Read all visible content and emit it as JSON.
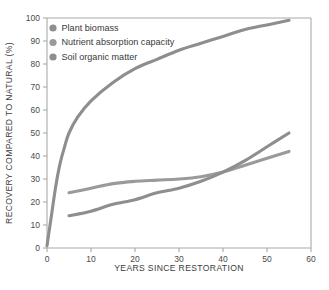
{
  "chart_data": {
    "type": "line",
    "title": "",
    "xlabel": "YEARS SINCE RESTORATION",
    "ylabel": "RECOVERY COMPARED TO NATURAL (%)",
    "xlim": [
      0,
      60
    ],
    "ylim": [
      0,
      100
    ],
    "xticks": [
      0,
      10,
      20,
      30,
      40,
      50,
      60
    ],
    "yticks": [
      0,
      10,
      20,
      30,
      40,
      50,
      60,
      70,
      80,
      90,
      100
    ],
    "grid": false,
    "legend_position": "top-left",
    "series": [
      {
        "name": "Plant biomass",
        "color": "#8e8e8e",
        "x": [
          0,
          1,
          2,
          3,
          4,
          5,
          7,
          10,
          15,
          20,
          25,
          30,
          35,
          40,
          45,
          50,
          55
        ],
        "y": [
          1,
          14,
          27,
          37,
          44,
          50,
          57,
          64,
          72,
          78,
          82,
          86,
          89,
          92,
          95,
          97,
          99
        ]
      },
      {
        "name": "Nutrient absorption capacity",
        "color": "#9a9a9a",
        "x": [
          5,
          10,
          15,
          20,
          25,
          30,
          35,
          40,
          45,
          50,
          55
        ],
        "y": [
          24,
          26,
          28,
          29,
          29.5,
          30,
          31,
          33,
          36,
          39,
          42
        ]
      },
      {
        "name": "Soil organic matter",
        "color": "#8e8e8e",
        "x": [
          5,
          10,
          15,
          20,
          25,
          30,
          35,
          40,
          45,
          50,
          55
        ],
        "y": [
          14,
          16,
          19,
          21,
          24,
          26,
          29,
          33,
          38,
          44,
          50
        ]
      }
    ]
  },
  "legend": {
    "items": [
      {
        "label": "Plant biomass",
        "color": "#8e8e8e"
      },
      {
        "label": "Nutrient absorption capacity",
        "color": "#9a9a9a"
      },
      {
        "label": "Soil organic matter",
        "color": "#8e8e8e"
      }
    ]
  },
  "axes": {
    "x_title": "YEARS SINCE RESTORATION",
    "y_title": "RECOVERY COMPARED TO NATURAL (%)",
    "x_tick_labels": [
      "0",
      "10",
      "20",
      "30",
      "40",
      "50",
      "60"
    ],
    "y_tick_labels": [
      "0",
      "10",
      "20",
      "30",
      "40",
      "50",
      "60",
      "70",
      "80",
      "90",
      "100"
    ]
  }
}
